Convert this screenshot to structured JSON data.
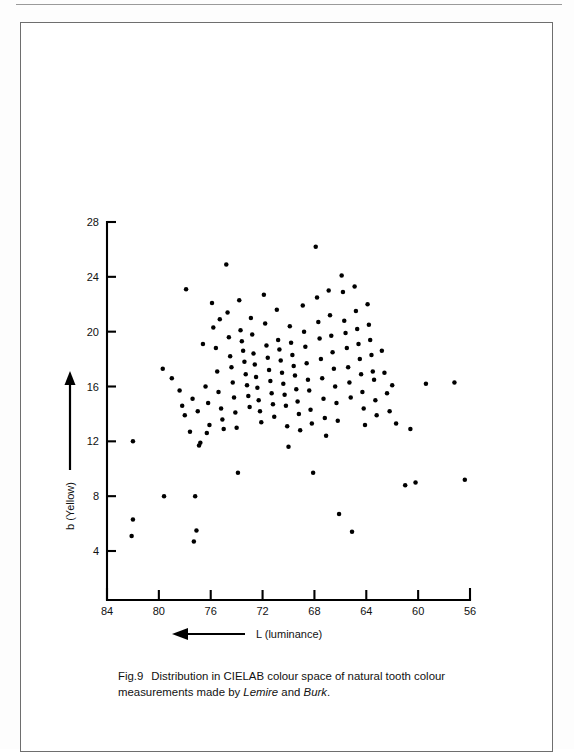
{
  "figure": {
    "caption_number": "Fig.9",
    "caption_part1": "Distribution in CIELAB colour space of natural tooth colour measurements made by ",
    "caption_author1": "Lemire",
    "caption_joiner": " and ",
    "caption_author2": "Burk",
    "caption_end": "."
  },
  "chart_data": {
    "type": "scatter",
    "title": "Distribution in CIELAB colour space of natural tooth colour measurements made by Lemire and Burk.",
    "xlabel": "L (luminance)",
    "ylabel": "b (Yellow)",
    "x_axis_reversed": true,
    "xlim": [
      84,
      56
    ],
    "ylim": [
      2.2,
      28
    ],
    "xticks": [
      84,
      80,
      76,
      72,
      68,
      64,
      60,
      56
    ],
    "yticks": [
      4,
      8,
      12,
      16,
      20,
      24,
      28
    ],
    "xtick_labels": [
      "84",
      "80",
      "76",
      "72",
      "68",
      "64",
      "60",
      "56"
    ],
    "ytick_labels": [
      "4",
      "8",
      "12",
      "16",
      "20",
      "24",
      "28"
    ],
    "grid": false,
    "legend": false,
    "x_arrow_direction": "left",
    "y_arrow_direction": "up",
    "marker": "filled-circle",
    "marker_color": "#000000",
    "n_points": 152,
    "points": [
      [
        82.0,
        12.0
      ],
      [
        82.0,
        6.3
      ],
      [
        82.1,
        5.1
      ],
      [
        79.6,
        8.0
      ],
      [
        79.7,
        17.3
      ],
      [
        79.0,
        16.6
      ],
      [
        78.2,
        14.6
      ],
      [
        78.4,
        15.7
      ],
      [
        78.0,
        13.9
      ],
      [
        77.6,
        12.7
      ],
      [
        77.2,
        8.0
      ],
      [
        77.1,
        5.5
      ],
      [
        77.3,
        4.7
      ],
      [
        77.9,
        23.1
      ],
      [
        77.4,
        15.1
      ],
      [
        77.0,
        14.2
      ],
      [
        76.8,
        11.9
      ],
      [
        76.9,
        11.7
      ],
      [
        76.6,
        19.1
      ],
      [
        76.4,
        16.0
      ],
      [
        76.2,
        14.8
      ],
      [
        76.1,
        13.2
      ],
      [
        76.3,
        12.6
      ],
      [
        75.9,
        22.1
      ],
      [
        75.8,
        20.3
      ],
      [
        75.6,
        18.8
      ],
      [
        75.5,
        17.1
      ],
      [
        75.4,
        15.6
      ],
      [
        75.2,
        14.4
      ],
      [
        75.1,
        13.6
      ],
      [
        75.0,
        12.9
      ],
      [
        75.3,
        20.9
      ],
      [
        74.8,
        24.9
      ],
      [
        74.7,
        21.4
      ],
      [
        74.6,
        19.6
      ],
      [
        74.5,
        18.2
      ],
      [
        74.4,
        17.4
      ],
      [
        74.3,
        16.3
      ],
      [
        74.2,
        15.2
      ],
      [
        74.1,
        14.1
      ],
      [
        74.0,
        13.0
      ],
      [
        73.8,
        22.3
      ],
      [
        73.7,
        20.1
      ],
      [
        73.6,
        19.3
      ],
      [
        73.5,
        18.6
      ],
      [
        73.4,
        17.8
      ],
      [
        73.3,
        16.9
      ],
      [
        73.2,
        16.1
      ],
      [
        73.1,
        15.3
      ],
      [
        73.0,
        14.5
      ],
      [
        72.9,
        21.0
      ],
      [
        72.8,
        19.8
      ],
      [
        72.7,
        18.4
      ],
      [
        72.6,
        17.6
      ],
      [
        72.5,
        16.7
      ],
      [
        72.4,
        15.9
      ],
      [
        72.3,
        15.0
      ],
      [
        72.2,
        14.2
      ],
      [
        72.1,
        13.4
      ],
      [
        71.9,
        22.7
      ],
      [
        71.8,
        20.6
      ],
      [
        71.7,
        19.0
      ],
      [
        71.6,
        18.1
      ],
      [
        71.5,
        17.2
      ],
      [
        71.4,
        16.4
      ],
      [
        71.3,
        15.5
      ],
      [
        71.2,
        14.7
      ],
      [
        71.1,
        13.8
      ],
      [
        70.9,
        21.6
      ],
      [
        70.8,
        19.4
      ],
      [
        70.7,
        18.7
      ],
      [
        70.6,
        17.9
      ],
      [
        70.5,
        17.0
      ],
      [
        70.4,
        16.2
      ],
      [
        70.3,
        15.4
      ],
      [
        70.2,
        14.6
      ],
      [
        70.1,
        13.1
      ],
      [
        69.9,
        20.4
      ],
      [
        69.8,
        19.2
      ],
      [
        69.7,
        18.3
      ],
      [
        69.6,
        17.5
      ],
      [
        69.5,
        16.8
      ],
      [
        69.4,
        15.8
      ],
      [
        69.3,
        14.9
      ],
      [
        69.2,
        14.0
      ],
      [
        69.1,
        12.8
      ],
      [
        68.9,
        21.9
      ],
      [
        68.8,
        20.0
      ],
      [
        68.7,
        18.9
      ],
      [
        68.6,
        17.7
      ],
      [
        68.5,
        16.5
      ],
      [
        68.4,
        15.7
      ],
      [
        68.3,
        14.3
      ],
      [
        68.2,
        13.3
      ],
      [
        68.1,
        9.7
      ],
      [
        67.9,
        26.2
      ],
      [
        67.8,
        22.5
      ],
      [
        67.7,
        20.7
      ],
      [
        67.6,
        19.5
      ],
      [
        67.5,
        18.0
      ],
      [
        67.4,
        16.6
      ],
      [
        67.3,
        15.1
      ],
      [
        67.2,
        13.7
      ],
      [
        67.1,
        12.4
      ],
      [
        66.9,
        23.0
      ],
      [
        66.8,
        21.2
      ],
      [
        66.7,
        19.7
      ],
      [
        66.6,
        18.5
      ],
      [
        66.5,
        17.3
      ],
      [
        66.4,
        16.0
      ],
      [
        66.3,
        14.8
      ],
      [
        66.2,
        13.5
      ],
      [
        66.1,
        6.7
      ],
      [
        65.9,
        24.1
      ],
      [
        65.8,
        22.9
      ],
      [
        65.7,
        20.8
      ],
      [
        65.6,
        19.9
      ],
      [
        65.5,
        18.8
      ],
      [
        65.4,
        17.4
      ],
      [
        65.3,
        16.3
      ],
      [
        65.2,
        15.2
      ],
      [
        65.1,
        5.4
      ],
      [
        64.9,
        23.3
      ],
      [
        64.8,
        21.5
      ],
      [
        64.7,
        20.2
      ],
      [
        64.6,
        19.1
      ],
      [
        64.5,
        18.0
      ],
      [
        64.4,
        16.9
      ],
      [
        64.3,
        15.6
      ],
      [
        64.2,
        14.4
      ],
      [
        64.1,
        13.2
      ],
      [
        63.9,
        22.0
      ],
      [
        63.8,
        20.5
      ],
      [
        63.7,
        19.4
      ],
      [
        63.6,
        18.3
      ],
      [
        63.5,
        17.1
      ],
      [
        63.4,
        16.5
      ],
      [
        63.3,
        15.0
      ],
      [
        63.2,
        13.9
      ],
      [
        62.8,
        18.6
      ],
      [
        62.6,
        17.0
      ],
      [
        62.4,
        15.5
      ],
      [
        62.2,
        14.2
      ],
      [
        62.0,
        16.1
      ],
      [
        61.7,
        13.3
      ],
      [
        61.0,
        8.8
      ],
      [
        60.6,
        12.9
      ],
      [
        60.2,
        9.0
      ],
      [
        59.4,
        16.2
      ],
      [
        57.2,
        16.3
      ],
      [
        56.4,
        9.2
      ],
      [
        73.9,
        9.7
      ],
      [
        70.0,
        11.6
      ]
    ]
  },
  "axis_labels": {
    "x_name": "L (luminance)",
    "y_name": "b (Yellow)"
  }
}
